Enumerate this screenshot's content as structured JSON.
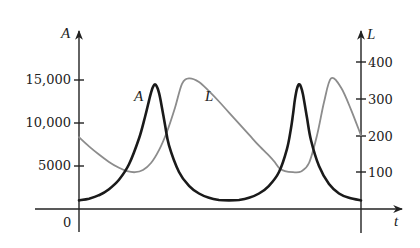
{
  "chart_data": {
    "type": "line",
    "title": "",
    "xlabel": "t",
    "ylabel_left": "A",
    "ylabel_right": "L",
    "x_tick_labels": [
      "0"
    ],
    "left_axis": {
      "label": "A",
      "ticks": [
        5000,
        10000,
        15000
      ],
      "tick_labels": [
        "5000",
        "10,000",
        "15,000"
      ],
      "ylim": [
        0,
        19000
      ]
    },
    "right_axis": {
      "label": "L",
      "ticks": [
        100,
        200,
        300,
        400
      ],
      "tick_labels": [
        "100",
        "200",
        "300",
        "400"
      ],
      "ylim": [
        0,
        480
      ]
    },
    "grid": false,
    "legend": "inline labels",
    "series": [
      {
        "name": "A",
        "axis": "left",
        "style": "thick black",
        "label_text": "A",
        "x": [
          0,
          10,
          20,
          30,
          40,
          50,
          60,
          66,
          70,
          72,
          74,
          76,
          78,
          80,
          82,
          86,
          90,
          100,
          110,
          120,
          130,
          140,
          150,
          160,
          170,
          180,
          190,
          200,
          208,
          212,
          214,
          216,
          218,
          220,
          222,
          224,
          228,
          232,
          240,
          250,
          260,
          270,
          282
        ],
        "values": [
          1000,
          1200,
          1600,
          2300,
          3400,
          5200,
          8200,
          10700,
          12600,
          13500,
          14200,
          14500,
          14200,
          13500,
          12400,
          9800,
          7400,
          4300,
          2700,
          1800,
          1300,
          1050,
          1000,
          1050,
          1300,
          1800,
          2700,
          4300,
          7000,
          9400,
          11000,
          12800,
          14000,
          14500,
          14200,
          13300,
          10600,
          8000,
          5000,
          2900,
          1800,
          1300,
          1000
        ]
      },
      {
        "name": "L",
        "axis": "right",
        "style": "thin gray",
        "label_text": "L",
        "x": [
          0,
          10,
          20,
          30,
          40,
          48,
          56,
          64,
          72,
          80,
          88,
          96,
          103,
          110,
          120,
          130,
          140,
          150,
          160,
          170,
          180,
          190,
          195,
          200,
          206,
          214,
          222,
          230,
          238,
          245,
          252,
          262,
          272,
          282
        ],
        "values": [
          195,
          170,
          148,
          128,
          112,
          103,
          100,
          106,
          125,
          160,
          210,
          275,
          340,
          355,
          345,
          320,
          292,
          262,
          232,
          202,
          172,
          145,
          130,
          112,
          103,
          100,
          102,
          125,
          200,
          290,
          355,
          330,
          270,
          200
        ]
      }
    ],
    "annotations": [
      {
        "text": "A",
        "near": "first peak of A, left side"
      },
      {
        "text": "L",
        "near": "first peak of L, right side"
      }
    ]
  }
}
